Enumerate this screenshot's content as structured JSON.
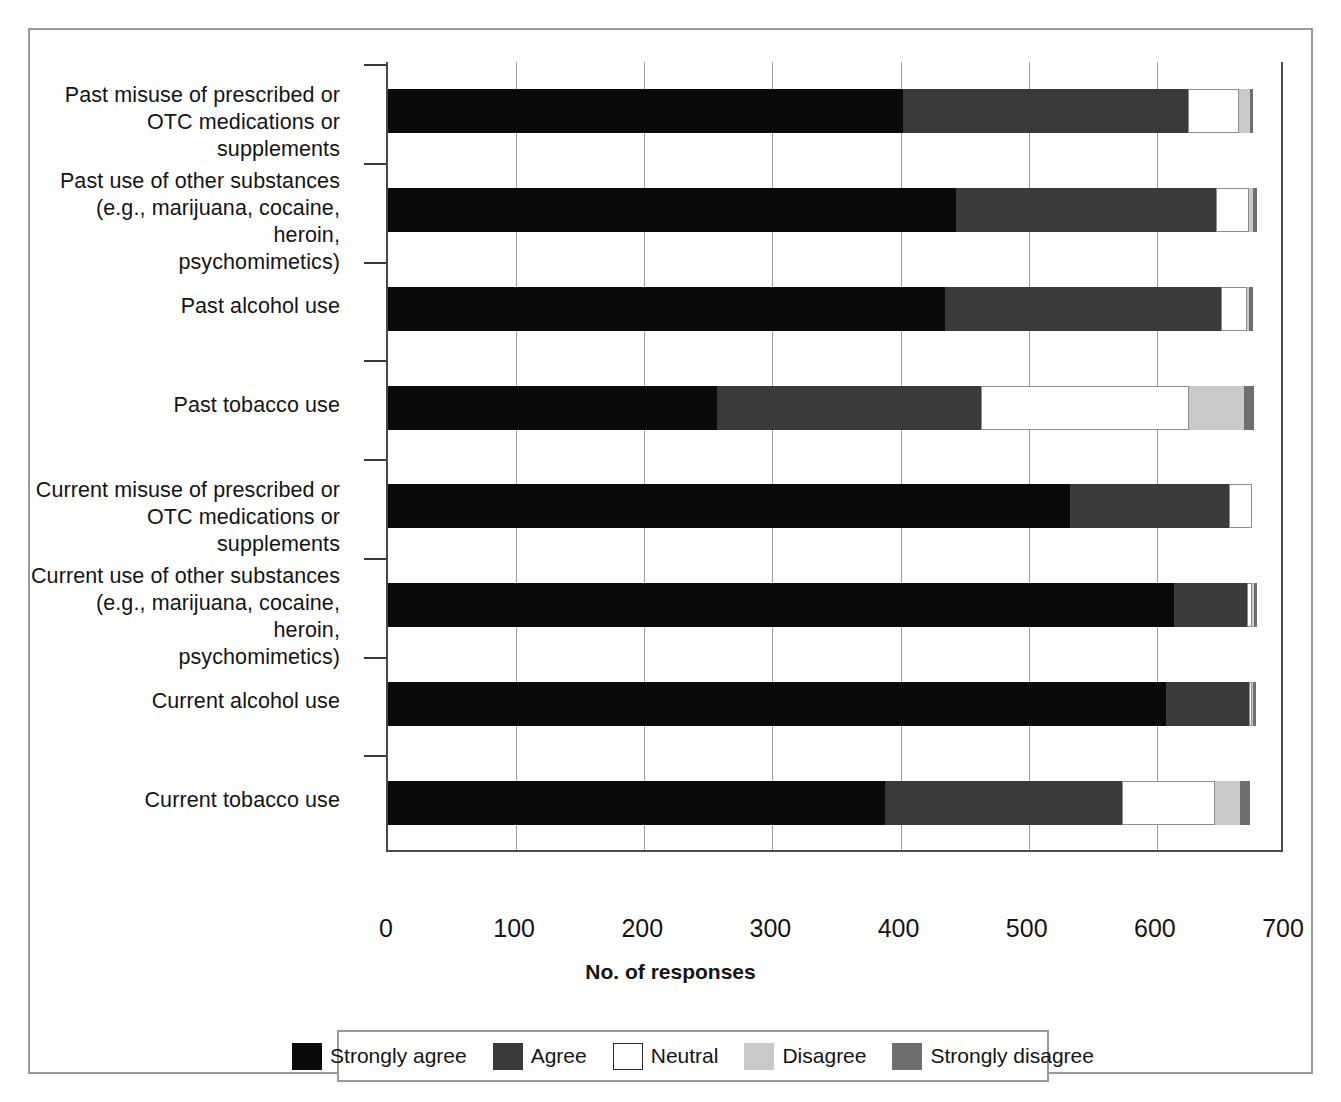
{
  "chart_data": {
    "type": "bar",
    "orientation": "horizontal",
    "stacked": true,
    "title": "",
    "xlabel": "No. of responses",
    "ylabel": "",
    "xlim": [
      0,
      700
    ],
    "xticks": [
      0,
      100,
      200,
      300,
      400,
      500,
      600,
      700
    ],
    "grid": true,
    "legend_position": "bottom",
    "categories": [
      "Past misuse of prescribed or OTC medications or supplements",
      "Past use of other substances (e.g., marijuana, cocaine, heroin, psychomimetics)",
      "Past alcohol use",
      "Past tobacco use",
      "Current misuse of prescribed or OTC medications or supplements",
      "Current use of other substances (e.g., marijuana, cocaine, heroin, psychomimetics)",
      "Current alcohol use",
      "Current tobacco use"
    ],
    "category_lines": [
      [
        "Past misuse of prescribed or",
        "OTC medications or supplements"
      ],
      [
        "Past use of other substances",
        "(e.g., marijuana, cocaine, heroin,",
        "psychomimetics)"
      ],
      [
        "Past alcohol use"
      ],
      [
        "Past tobacco use"
      ],
      [
        "Current misuse of prescribed or",
        "OTC medications or supplements"
      ],
      [
        "Current use of other substances",
        "(e.g., marijuana, cocaine, heroin,",
        "psychomimetics)"
      ],
      [
        "Current alcohol use"
      ],
      [
        "Current tobacco use"
      ]
    ],
    "series": [
      {
        "name": "Strongly agree",
        "color": "#0a0a0a",
        "values": [
          402,
          443,
          435,
          257,
          532,
          613,
          607,
          388
        ]
      },
      {
        "name": "Agree",
        "color": "#3a3a3a",
        "values": [
          222,
          203,
          215,
          206,
          124,
          57,
          65,
          185
        ]
      },
      {
        "name": "Neutral",
        "color": "#ffffff",
        "values": [
          40,
          26,
          20,
          162,
          18,
          4,
          2,
          72
        ]
      },
      {
        "name": "Disagree",
        "color": "#c9c9c9",
        "values": [
          9,
          3,
          2,
          43,
          0,
          2,
          1,
          20
        ]
      },
      {
        "name": "Strongly disagree",
        "color": "#6e6e6e",
        "values": [
          2,
          3,
          3,
          8,
          0,
          2,
          2,
          8
        ]
      }
    ]
  },
  "legend": {
    "items": [
      {
        "label": "Strongly agree",
        "color": "#0a0a0a"
      },
      {
        "label": "Agree",
        "color": "#3a3a3a"
      },
      {
        "label": "Neutral",
        "color": "#ffffff"
      },
      {
        "label": "Disagree",
        "color": "#c9c9c9"
      },
      {
        "label": "Strongly disagree",
        "color": "#6e6e6e"
      }
    ]
  }
}
